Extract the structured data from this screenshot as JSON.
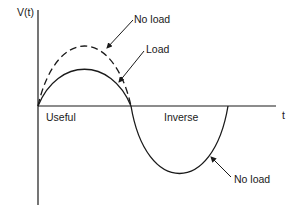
{
  "diagram": {
    "y_axis_label": "V(t)",
    "x_axis_label": "t",
    "region_labels": {
      "positive": "Useful",
      "negative": "Inverse"
    },
    "curves": [
      {
        "name": "No load",
        "style": "dashed",
        "half_cycle": "positive",
        "peak_relative": 1.0
      },
      {
        "name": "Load",
        "style": "solid",
        "half_cycle": "positive",
        "peak_relative": 0.57
      },
      {
        "name": "No load",
        "style": "solid",
        "half_cycle": "negative",
        "peak_relative": 1.0
      }
    ],
    "callouts": [
      {
        "text": "No load",
        "target": "dashed positive curve"
      },
      {
        "text": "Load",
        "target": "solid positive curve"
      },
      {
        "text": "No load",
        "target": "solid negative curve"
      }
    ]
  }
}
